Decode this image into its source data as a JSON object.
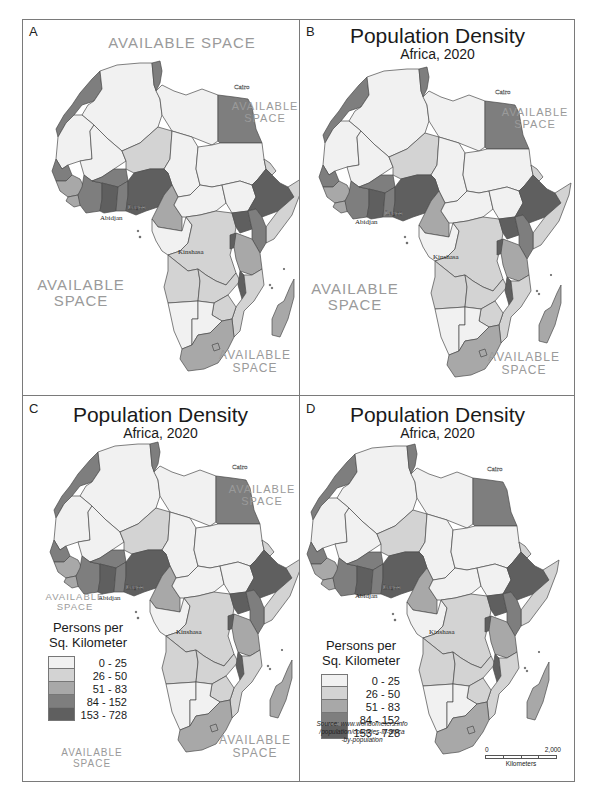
{
  "map_title": "Population Density",
  "map_subtitle": "Africa, 2020",
  "legend": {
    "title_line1": "Persons per",
    "title_line2": "Sq. Kilometer",
    "classes": [
      {
        "label": "0 - 25",
        "color": "#f1f1f1"
      },
      {
        "label": "26 - 50",
        "color": "#d3d3d3"
      },
      {
        "label": "51 - 83",
        "color": "#a8a8a8"
      },
      {
        "label": "84 - 152",
        "color": "#7e7e7e"
      },
      {
        "label": "153 - 728",
        "color": "#5f5f5f"
      }
    ]
  },
  "cities": [
    "Cairo",
    "Lagos",
    "Abidjan",
    "Kinshasa"
  ],
  "available_space": {
    "line1": "AVAILABLE",
    "line2": "SPACE",
    "single": "AVAILABLE SPACE"
  },
  "source": {
    "line1": "Source: www.worldometers.info",
    "line2": "/population/countries-in-africa",
    "line3": "-by-population"
  },
  "scale_bar": {
    "start": "0",
    "end": "2,000",
    "unit": "Kilometers"
  },
  "panels": [
    {
      "letter": "A"
    },
    {
      "letter": "B"
    },
    {
      "letter": "C"
    },
    {
      "letter": "D"
    }
  ]
}
